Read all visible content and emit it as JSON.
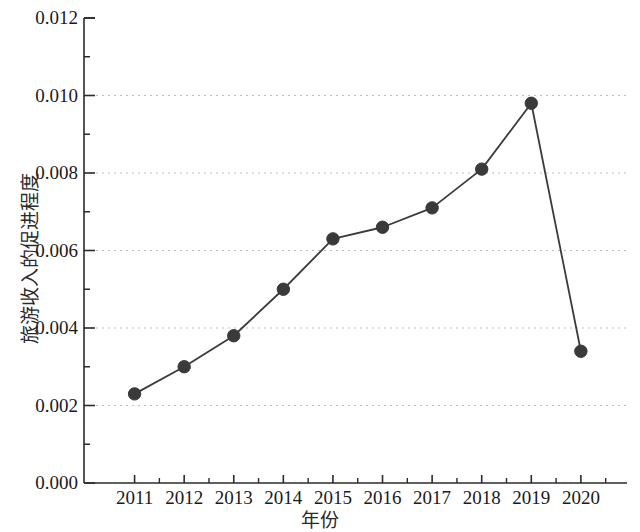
{
  "chart_data": {
    "type": "line",
    "title": "",
    "subtitle": "",
    "xlabel": "年份",
    "ylabel": "旅游收入的促进程度",
    "categories": [
      "2011",
      "2012",
      "2013",
      "2014",
      "2015",
      "2016",
      "2017",
      "2018",
      "2019",
      "2020"
    ],
    "x": [
      2011,
      2012,
      2013,
      2014,
      2015,
      2016,
      2017,
      2018,
      2019,
      2020
    ],
    "values": [
      0.0023,
      0.003,
      0.0038,
      0.005,
      0.0063,
      0.0066,
      0.0071,
      0.0081,
      0.0098,
      0.0034
    ],
    "series": [
      {
        "name": "旅游收入的促进程度",
        "values": [
          0.0023,
          0.003,
          0.0038,
          0.005,
          0.0063,
          0.0066,
          0.0071,
          0.0081,
          0.0098,
          0.0034
        ]
      }
    ],
    "ylim": [
      0.0,
      0.012
    ],
    "xlim": [
      2010.5,
      2020.5
    ],
    "ytick_labels": [
      "0.000",
      "0.002",
      "0.004",
      "0.006",
      "0.008",
      "0.010",
      "0.012"
    ],
    "ytick_values": [
      0.0,
      0.002,
      0.004,
      0.006,
      0.008,
      0.01,
      0.012
    ],
    "yminor_tick_values": [
      0.001,
      0.003,
      0.005,
      0.007,
      0.009,
      0.011
    ],
    "xtick_labels": [
      "2011",
      "2012",
      "2013",
      "2014",
      "2015",
      "2016",
      "2017",
      "2018",
      "2019",
      "2020"
    ],
    "grid": "horizontal-dotted",
    "legend": "none",
    "marker": "filled-circle",
    "line_color": "#3b3b3b",
    "marker_color": "#3a3a3a",
    "grid_color": "#bdbdbd",
    "axis_color": "#2b2b2b",
    "annotations": []
  },
  "axis": {
    "y_title": "旅游收入的促进程度",
    "x_title": "年份"
  }
}
